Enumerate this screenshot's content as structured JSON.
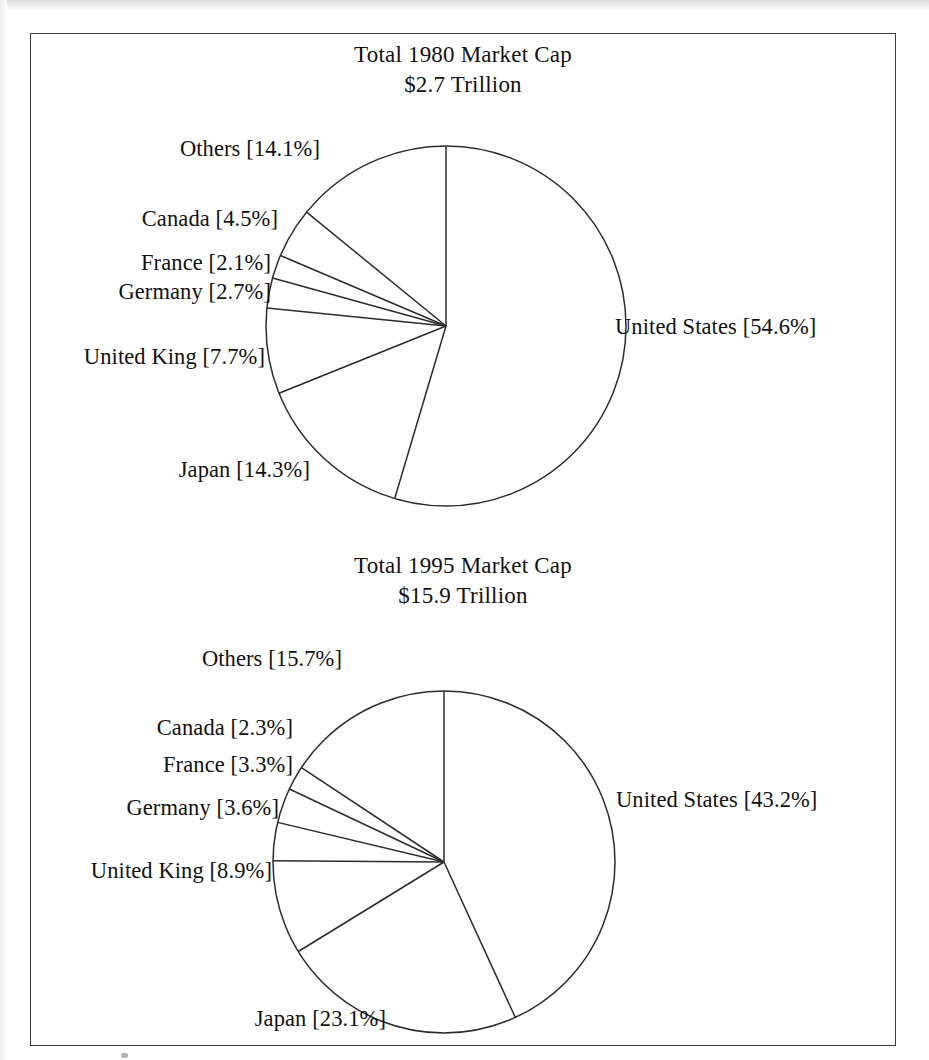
{
  "figure": {
    "charts": [
      {
        "title_line1": "Total 1980 Market Cap",
        "title_line2": "$2.7 Trillion",
        "labels": {
          "united_states": "United States [54.6%]",
          "japan": "Japan [14.3%]",
          "united_kingdom": "United King [7.7%]",
          "germany": "Germany [2.7%]",
          "france": "France [2.1%]",
          "canada": "Canada [4.5%]",
          "others": "Others [14.1%]"
        }
      },
      {
        "title_line1": "Total 1995 Market Cap",
        "title_line2": "$15.9 Trillion",
        "labels": {
          "united_states": "United States [43.2%]",
          "japan": "Japan [23.1%]",
          "united_kingdom": "United King [8.9%]",
          "germany": "Germany [3.6%]",
          "france": "France [3.3%]",
          "canada": "Canada [2.3%]",
          "others": "Others [15.7%]"
        }
      }
    ]
  },
  "chart_data": [
    {
      "type": "pie",
      "title": "Total 1980 Market Cap $2.7 Trillion",
      "subtitle": "$2.7 Trillion",
      "total": "$2.7 Trillion",
      "unit": "percent of world market capitalization",
      "start_angle_deg": 0,
      "direction": "clockwise",
      "categories": [
        "United States",
        "Japan",
        "United King",
        "Germany",
        "France",
        "Canada",
        "Others"
      ],
      "values": [
        54.6,
        14.3,
        7.7,
        2.7,
        2.1,
        4.5,
        14.1
      ],
      "labels": [
        "United States [54.6%]",
        "Japan [14.3%]",
        "United King [7.7%]",
        "Germany [2.7%]",
        "France [2.1%]",
        "Canada [4.5%]",
        "Others [14.1%]"
      ],
      "slice_fill": "#ffffff",
      "slice_stroke": "#2b2b2b",
      "legend": "none",
      "labels_position": "outside"
    },
    {
      "type": "pie",
      "title": "Total 1995 Market Cap $15.9 Trillion",
      "subtitle": "$15.9 Trillion",
      "total": "$15.9 Trillion",
      "unit": "percent of world market capitalization",
      "start_angle_deg": 0,
      "direction": "clockwise",
      "categories": [
        "United States",
        "Japan",
        "United King",
        "Germany",
        "France",
        "Canada",
        "Others"
      ],
      "values": [
        43.2,
        23.1,
        8.9,
        3.6,
        3.3,
        2.3,
        15.7
      ],
      "labels": [
        "United States [43.2%]",
        "Japan [23.1%]",
        "United King [8.9%]",
        "Germany [3.6%]",
        "France [3.3%]",
        "Canada [2.3%]",
        "Others [15.7%]"
      ],
      "slice_fill": "#ffffff",
      "slice_stroke": "#2b2b2b",
      "legend": "none",
      "labels_position": "outside"
    }
  ]
}
